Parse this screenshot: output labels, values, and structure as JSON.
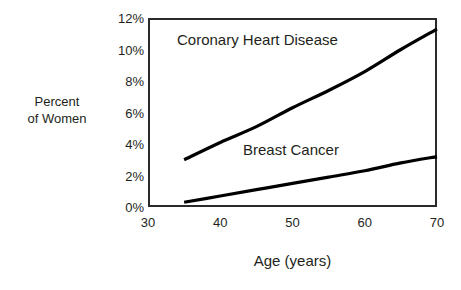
{
  "chart_data": {
    "type": "line",
    "title": "",
    "xlabel": "Age (years)",
    "ylabel": "Percent of Women",
    "ylabel_line1": "Percent",
    "ylabel_line2": "of Women",
    "xlim": [
      30,
      70
    ],
    "ylim": [
      0,
      12
    ],
    "grid": false,
    "legend_position": "inline-annotations",
    "x_ticks": [
      30,
      40,
      50,
      60,
      70
    ],
    "x_tick_labels": [
      "30",
      "40",
      "50",
      "60",
      "70"
    ],
    "y_ticks": [
      0,
      2,
      4,
      6,
      8,
      10,
      12
    ],
    "y_tick_labels": [
      "0%",
      "2%",
      "4%",
      "6%",
      "8%",
      "10%",
      "12%"
    ],
    "x": [
      35,
      40,
      45,
      50,
      55,
      60,
      65,
      70
    ],
    "series": [
      {
        "name": "Coronary Heart Disease",
        "label": "Coronary Heart Disease",
        "color": "#000000",
        "values": [
          3.0,
          4.1,
          5.1,
          6.3,
          7.4,
          8.6,
          10.0,
          11.3
        ]
      },
      {
        "name": "Breast Cancer",
        "label": "Breast Cancer",
        "color": "#000000",
        "values": [
          0.3,
          0.7,
          1.1,
          1.5,
          1.9,
          2.3,
          2.8,
          3.2
        ]
      }
    ],
    "annotations": [
      {
        "text": "Coronary Heart Disease",
        "x": 37,
        "y": 11.2
      },
      {
        "text": "Breast Cancer",
        "x": 51,
        "y": 4.0
      }
    ]
  },
  "axes": {
    "x_title": "Age (years)",
    "y_title_line1": "Percent",
    "y_title_line2": "of Women",
    "y_labels": [
      "12%",
      "10%",
      "8%",
      "6%",
      "4%",
      "2%",
      "0%"
    ],
    "x_labels": [
      "30",
      "40",
      "50",
      "60",
      "70"
    ]
  },
  "labels": {
    "chd": "Coronary Heart Disease",
    "breast_cancer": "Breast Cancer"
  },
  "colors": {
    "background": "#ffffff",
    "frame": "#2a2a2a",
    "line": "#000000",
    "text": "#231f20"
  }
}
